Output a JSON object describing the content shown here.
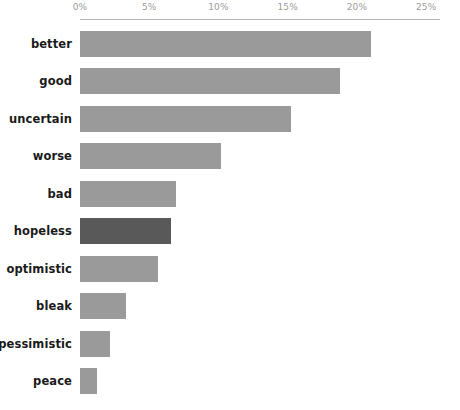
{
  "chart_data": {
    "type": "bar",
    "orientation": "horizontal",
    "title": "",
    "xlabel": "",
    "ylabel": "",
    "categories": [
      "better",
      "good",
      "uncertain",
      "worse",
      "bad",
      "hopeless",
      "optimistic",
      "bleak",
      "pessimistic",
      "peace"
    ],
    "values": [
      21.0,
      18.8,
      15.2,
      10.2,
      6.9,
      6.6,
      5.6,
      3.3,
      2.2,
      1.2
    ],
    "value_unit": "%",
    "xlim": [
      0,
      25
    ],
    "xticks": [
      0,
      5,
      10,
      15,
      20,
      25
    ],
    "xtick_labels": [
      "0%",
      "5%",
      "10%",
      "15%",
      "20%",
      "25%"
    ],
    "axis_position": "top",
    "grid": false,
    "legend": null,
    "bar_color": "#9a9a9a",
    "highlight_color": "#595959",
    "highlighted_categories": [
      "hopeless"
    ],
    "axis_line_color": "#b9b9b9",
    "tick_label_color": "#9c9c9c",
    "category_label_color": "#1a1a1a",
    "background": "#ffffff"
  }
}
